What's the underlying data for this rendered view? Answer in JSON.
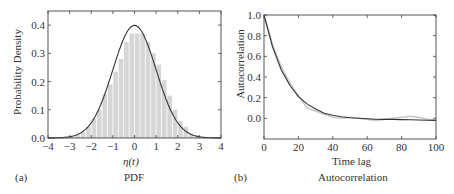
{
  "chart_data": [
    {
      "panel": "(a)",
      "type": "bar",
      "title": "PDF",
      "xlabel": "η(t)",
      "ylabel": "Probability Density",
      "xlim": [
        -4,
        4
      ],
      "ylim": [
        0,
        0.45
      ],
      "xticks": [
        "−4",
        "−3",
        "−2",
        "−1",
        "0",
        "1",
        "2",
        "3",
        "4"
      ],
      "yticks": [
        "0.0",
        "0.1",
        "0.2",
        "0.3",
        "0.4"
      ],
      "grid": false,
      "histogram": {
        "bin_width": 0.25,
        "bin_starts": [
          -3.0,
          -2.75,
          -2.5,
          -2.25,
          -2.0,
          -1.75,
          -1.5,
          -1.25,
          -1.0,
          -0.75,
          -0.5,
          -0.25,
          0.0,
          0.25,
          0.5,
          0.75,
          1.0,
          1.25,
          1.5,
          1.75,
          2.0,
          2.25,
          2.5,
          2.75
        ],
        "values": [
          0.005,
          0.01,
          0.02,
          0.04,
          0.07,
          0.1,
          0.155,
          0.19,
          0.235,
          0.28,
          0.34,
          0.37,
          0.37,
          0.37,
          0.34,
          0.3,
          0.26,
          0.205,
          0.15,
          0.1,
          0.06,
          0.04,
          0.015,
          0.01
        ],
        "color": "#d6d6d6"
      },
      "series": [
        {
          "name": "Gaussian fit N(0,1)",
          "type": "line",
          "color": "#333333",
          "x": [
            -4,
            -3.5,
            -3,
            -2.5,
            -2,
            -1.5,
            -1,
            -0.5,
            0,
            0.5,
            1,
            1.5,
            2,
            2.5,
            3,
            3.5,
            4
          ],
          "values": [
            0.0001,
            0.0009,
            0.0044,
            0.0175,
            0.054,
            0.1295,
            0.242,
            0.352,
            0.399,
            0.352,
            0.242,
            0.1295,
            0.054,
            0.0175,
            0.0044,
            0.0009,
            0.0001
          ]
        }
      ]
    },
    {
      "panel": "(b)",
      "type": "line",
      "title": "Autocorrelation",
      "xlabel": "Time lag",
      "ylabel": "Autocorrelation",
      "xlim": [
        0,
        100
      ],
      "ylim": [
        -0.2,
        1.0
      ],
      "xticks": [
        "0",
        "20",
        "40",
        "60",
        "80",
        "100"
      ],
      "yticks": [
        "0.0",
        "0.2",
        "0.4",
        "0.6",
        "0.8",
        "1.0"
      ],
      "grid": false,
      "series": [
        {
          "name": "Empirical autocorrelation",
          "color": "#c8c8c8",
          "x": [
            0,
            5,
            10,
            15,
            20,
            25,
            30,
            35,
            40,
            45,
            50,
            55,
            60,
            65,
            70,
            75,
            80,
            85,
            90,
            95,
            100
          ],
          "values": [
            1.0,
            0.71,
            0.5,
            0.34,
            0.22,
            0.1,
            0.07,
            0.04,
            0.01,
            0.0,
            0.01,
            0.0,
            -0.01,
            -0.02,
            -0.01,
            0.0,
            0.01,
            0.02,
            0.01,
            -0.01,
            -0.02
          ]
        },
        {
          "name": "Exponential fit",
          "color": "#333333",
          "x": [
            0,
            5,
            10,
            15,
            20,
            25,
            30,
            35,
            40,
            45,
            50,
            55,
            60,
            65,
            70,
            75,
            80,
            85,
            90,
            95,
            100
          ],
          "values": [
            1.0,
            0.69,
            0.47,
            0.32,
            0.21,
            0.14,
            0.09,
            0.05,
            0.03,
            0.015,
            0.005,
            0.0,
            -0.005,
            -0.008,
            -0.01,
            -0.01,
            -0.012,
            -0.014,
            -0.016,
            -0.018,
            -0.02
          ]
        }
      ]
    }
  ],
  "panels": {
    "a": {
      "tag": "(a)",
      "caption": "PDF",
      "xlabel": "η(t)",
      "ylabel": "Probability Density"
    },
    "b": {
      "tag": "(b)",
      "caption": "Autocorrelation",
      "xlabel": "Time lag",
      "ylabel": "Autocorrelation"
    }
  }
}
